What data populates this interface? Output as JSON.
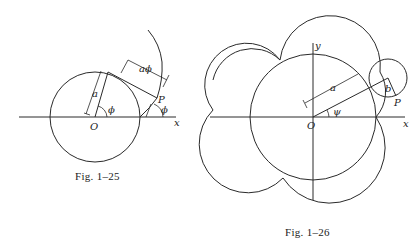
{
  "figures": [
    {
      "id": "fig-1-25",
      "caption": "Fig. 1–25",
      "labels": {
        "origin": "O",
        "point": "P",
        "radius": "a",
        "arc_length": "aϕ",
        "angle_center": "ϕ",
        "angle_tangent": "ϕ",
        "axis_x": "x"
      }
    },
    {
      "id": "fig-1-26",
      "caption": "Fig. 1–26",
      "labels": {
        "origin": "O",
        "point": "P",
        "radius_big": "a",
        "radius_small": "b",
        "angle": "ψ",
        "axis_x": "x",
        "axis_y": "y"
      }
    }
  ]
}
